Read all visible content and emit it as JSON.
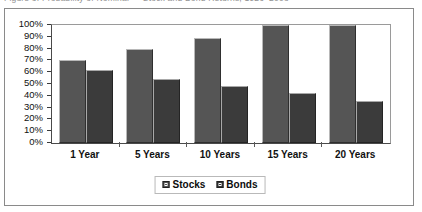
{
  "caption": {
    "text": "Figure 3. Probability of Nominal — Stock and Bond Returns, 1926–2008"
  },
  "chart_data": {
    "type": "bar",
    "title": "",
    "subtitle": "",
    "xlabel": "",
    "ylabel": "",
    "categories": [
      "1 Year",
      "5 Years",
      "10 Years",
      "15 Years",
      "20 Years"
    ],
    "series": [
      {
        "name": "Stocks",
        "color": "#555555",
        "values": [
          70,
          80,
          89,
          100,
          100
        ]
      },
      {
        "name": "Bonds",
        "color": "#3b3b3b",
        "values": [
          62,
          54,
          48,
          42,
          36
        ]
      }
    ],
    "ylim": [
      0,
      100
    ],
    "ytick_step": 10,
    "ytick_labels": [
      "100%",
      "90%",
      "80%",
      "70%",
      "60%",
      "50%",
      "40%",
      "30%",
      "20%",
      "10%",
      "0%"
    ],
    "ytick_values": [
      100,
      90,
      80,
      70,
      60,
      50,
      40,
      30,
      20,
      10,
      0
    ],
    "grid": false,
    "legend_position": "bottom-center",
    "legend_entries": [
      "Stocks",
      "Bonds"
    ]
  }
}
